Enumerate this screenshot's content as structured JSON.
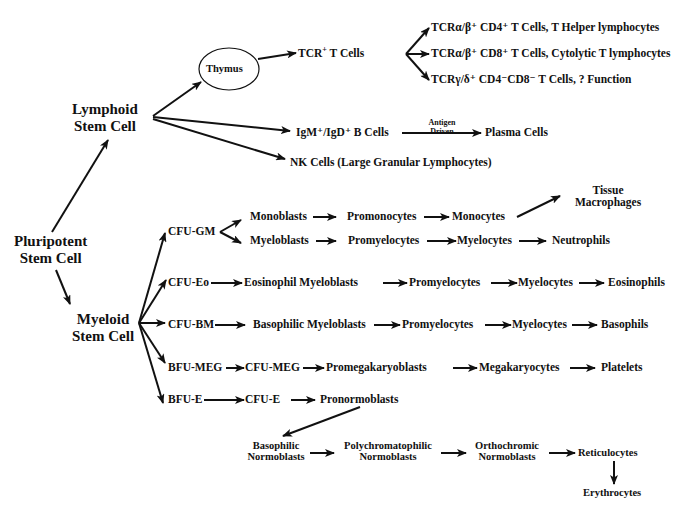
{
  "diagram": {
    "type": "hematopoiesis-lineage-tree",
    "root": {
      "line1": "Pluripotent",
      "line2": "Stem Cell"
    },
    "lymphoid": {
      "line1": "Lymphoid",
      "line2": "Stem Cell",
      "thymus": "Thymus",
      "tcr_cells": "TCR",
      "tcr_sup": "+",
      "tcr_suffix": " T Cells",
      "t_subsets": [
        "TCRα/β⁺ CD4⁺ T Cells, T Helper lymphocytes",
        "TCRα/β⁺ CD8⁺ T Cells, Cytolytic T lymphocytes",
        "TCRγ/δ⁺ CD4⁻CD8⁻ T Cells, ? Function"
      ],
      "b_cells": "IgM⁺/IgD⁺ B Cells",
      "antigen_top": "Antigen",
      "antigen_bottom": "Driven",
      "plasma": "Plasma Cells",
      "nk": "NK Cells (Large Granular Lymphocytes)"
    },
    "myeloid": {
      "line1": "Myeloid",
      "line2": "Stem Cell",
      "cfu_gm": "CFU-GM",
      "mono_row": [
        "Monoblasts",
        "Promonocytes",
        "Monocytes"
      ],
      "macrophage_line1": "Tissue",
      "macrophage_line2": "Macrophages",
      "neutro_row": [
        "Myeloblasts",
        "Promyelocytes",
        "Myelocytes",
        "Neutrophils"
      ],
      "eo_row": [
        "CFU-Eo",
        "Eosinophil Myeloblasts",
        "Promyelocytes",
        "Myelocytes",
        "Eosinophils"
      ],
      "baso_row": [
        "CFU-BM",
        "Basophilic Myeloblasts",
        "Promyelocytes",
        "Myelocytes",
        "Basophils"
      ],
      "meg_row": [
        "BFU-MEG",
        "CFU-MEG",
        "Promegakaryoblasts",
        "Megakaryocytes",
        "Platelets"
      ],
      "ery_row": [
        "BFU-E",
        "CFU-E",
        "Pronormoblasts"
      ],
      "ery_lower": [
        {
          "line1": "Basophilic",
          "line2": "Normoblasts"
        },
        {
          "line1": "Polychromatophilic",
          "line2": "Normoblasts"
        },
        {
          "line1": "Orthochromic",
          "line2": "Normoblasts"
        }
      ],
      "reticulocytes": "Reticulocytes",
      "erythrocytes": "Erythrocytes"
    }
  }
}
